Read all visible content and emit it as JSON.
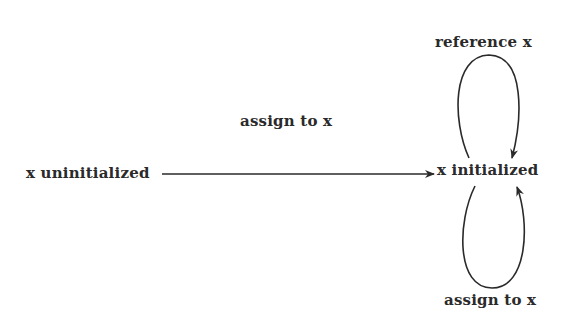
{
  "diagram": {
    "type": "state-transition",
    "states": [
      {
        "id": "uninit",
        "label": "x uninitialized"
      },
      {
        "id": "init",
        "label": "x initialized"
      }
    ],
    "transitions": [
      {
        "from": "uninit",
        "to": "init",
        "label": "assign to x"
      },
      {
        "from": "init",
        "to": "init",
        "label": "reference x",
        "position": "top-loop"
      },
      {
        "from": "init",
        "to": "init",
        "label": "assign to x",
        "position": "bottom-loop"
      }
    ],
    "colors": {
      "ink": "#2a2a2a",
      "background": "#ffffff"
    }
  }
}
